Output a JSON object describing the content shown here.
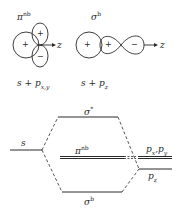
{
  "orbitals": {
    "pi_nb": {
      "label": "π",
      "label_sup": "nb",
      "combination": "s + p",
      "combination_sub": "x,y",
      "signs": [
        "+",
        "+",
        "−"
      ],
      "axis_label": "z"
    },
    "sigma_b": {
      "label": "σ",
      "label_sup": "b",
      "combination": "s + p",
      "combination_sub": "z",
      "signs": [
        "+",
        "+",
        "−"
      ],
      "axis_label": "z"
    }
  },
  "energy_diagram": {
    "left_level": {
      "label": "s"
    },
    "levels": [
      {
        "label": "σ",
        "sup": "*"
      },
      {
        "label": "π",
        "sup": "nb"
      },
      {
        "label": "σ",
        "sup": "b"
      }
    ],
    "right_levels": [
      {
        "label": "p",
        "sub1": "x",
        "sep": ",",
        "label2": "p",
        "sub2": "y"
      },
      {
        "label": "p",
        "sub": "z"
      }
    ]
  },
  "colors": {
    "line": "#2a2a2a",
    "background": "#ffffff"
  }
}
